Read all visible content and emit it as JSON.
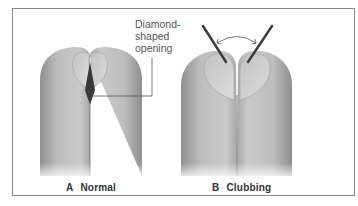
{
  "figure": {
    "callout": {
      "lines": [
        "Diamond-",
        "shaped",
        "opening"
      ]
    },
    "panels": [
      {
        "letter": "A",
        "label": "Normal"
      },
      {
        "letter": "B",
        "label": "Clubbing"
      }
    ]
  },
  "colors": {
    "border": "#8a8a8a",
    "skin_light": "#e6e6e6",
    "skin_mid": "#b8b8b8",
    "skin_dark": "#8d8d8d",
    "nail": "#d0d0d0",
    "diamond": "#3a3a3a",
    "angle_line": "#3a3a3a",
    "text": "#333333"
  }
}
